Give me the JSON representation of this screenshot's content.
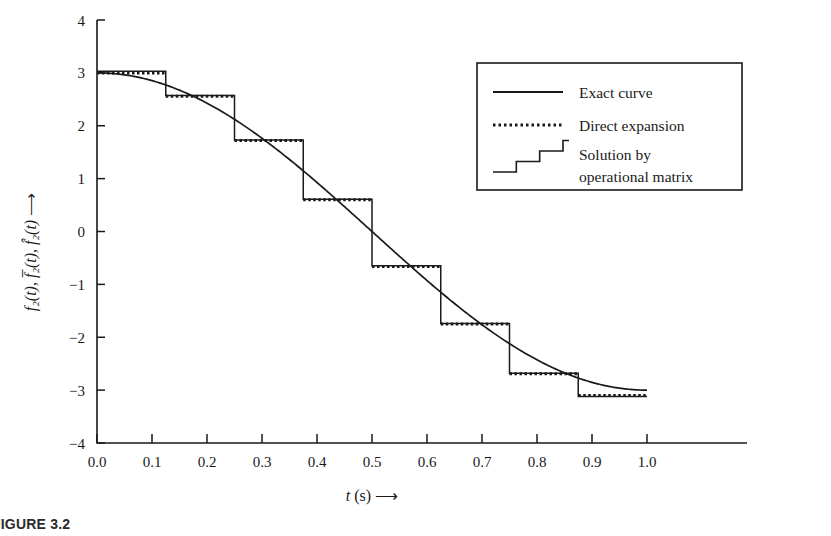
{
  "figure": {
    "caption": "FIGURE 3.2",
    "background": "#ffffff",
    "ink": "#1a1a1a"
  },
  "axes": {
    "x": {
      "label_prefix": "t",
      "label_unit": "(s)",
      "label_arrow": "⟶",
      "ticks": [
        "0.0",
        "0.1",
        "0.2",
        "0.3",
        "0.4",
        "0.5",
        "0.6",
        "0.7",
        "0.8",
        "0.9",
        "1.0"
      ],
      "tick_values": [
        0.0,
        0.1,
        0.2,
        0.3,
        0.4,
        0.5,
        0.6,
        0.7,
        0.8,
        0.9,
        1.0
      ],
      "min": 0.0,
      "max": 1.0
    },
    "y": {
      "label": "f₂(t), f̅₂(t), f̂₂(t)",
      "label_arrow": "⟶",
      "ticks": [
        "4",
        "3",
        "2",
        "1",
        "0",
        "−1",
        "−2",
        "−3",
        "−4"
      ],
      "tick_values": [
        4,
        3,
        2,
        1,
        0,
        -1,
        -2,
        -3,
        -4
      ],
      "min": -4,
      "max": 4
    }
  },
  "legend": {
    "position": "top-right",
    "border_color": "#1a1a1a",
    "items": [
      {
        "label": "Exact curve",
        "style": "solid",
        "sample": "line"
      },
      {
        "label": "Direct expansion",
        "style": "dotted",
        "sample": "dotted-line"
      },
      {
        "label_line1": "Solution by",
        "label_line2": "operational matrix",
        "style": "solid",
        "sample": "staircase"
      }
    ]
  },
  "chart_data": {
    "type": "line",
    "title": "",
    "xlabel": "t (s)",
    "ylabel": "f2(t), f2bar(t), f2hat(t)",
    "xlim": [
      0.0,
      1.0
    ],
    "ylim": [
      -4,
      4
    ],
    "grid": false,
    "legend_position": "upper right",
    "series": [
      {
        "name": "Exact curve",
        "style": "solid",
        "x": [
          0.0,
          0.05,
          0.1,
          0.15,
          0.2,
          0.25,
          0.3,
          0.35,
          0.4,
          0.45,
          0.5,
          0.55,
          0.6,
          0.65,
          0.7,
          0.75,
          0.8,
          0.85,
          0.9,
          0.95,
          1.0
        ],
        "y": [
          3.0,
          2.96,
          2.85,
          2.68,
          2.43,
          2.12,
          1.76,
          1.36,
          0.93,
          0.47,
          0.0,
          -0.47,
          -0.93,
          -1.36,
          -1.76,
          -2.12,
          -2.43,
          -2.68,
          -2.85,
          -2.96,
          -3.0
        ]
      },
      {
        "name": "Direct expansion",
        "style": "dotted",
        "interval_edges": [
          0.0,
          0.125,
          0.25,
          0.375,
          0.5,
          0.625,
          0.75,
          0.875,
          1.0
        ],
        "values": [
          3.0,
          2.56,
          1.72,
          0.6,
          -0.66,
          -1.75,
          -2.69,
          -3.1
        ]
      },
      {
        "name": "Solution by operational matrix",
        "style": "staircase",
        "interval_edges": [
          0.0,
          0.125,
          0.25,
          0.375,
          0.5,
          0.625,
          0.75,
          0.875,
          1.0
        ],
        "values": [
          3.03,
          2.57,
          1.73,
          0.61,
          -0.65,
          -1.74,
          -2.68,
          -3.12
        ]
      }
    ]
  }
}
